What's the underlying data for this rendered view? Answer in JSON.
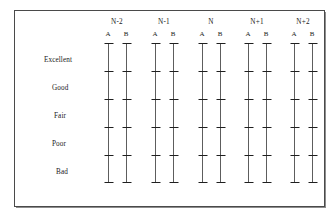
{
  "figure": {
    "title": "",
    "row_labels": [
      "Excellent",
      "Good",
      "Fair",
      "Poor",
      "Bad"
    ],
    "group_labels": [
      "N-2",
      "N-1",
      "N",
      "N+1",
      "N+2"
    ],
    "sub_labels": [
      "A",
      "B"
    ],
    "line_color": "#5d5d5d",
    "tick_color": "#1f1f1f",
    "border_color": "#4a4a4a",
    "background": "#ffffff"
  },
  "chart_data": {
    "type": "scatter",
    "title": "",
    "xlabel": "",
    "ylabel": "",
    "grid": false,
    "legend": "none",
    "categories": [
      "N-2",
      "N-1",
      "N",
      "N+1",
      "N+2"
    ],
    "subcategories": [
      "A",
      "B"
    ],
    "y_categories": [
      "Excellent",
      "Good",
      "Fair",
      "Poor",
      "Bad"
    ],
    "ylim": [
      0,
      5
    ],
    "ticks_per_axis": 6,
    "series": [
      {
        "name": "N-2 A",
        "group": "N-2",
        "sub": "A",
        "tick_levels": [
          5,
          4,
          3,
          2,
          1,
          0
        ]
      },
      {
        "name": "N-2 B",
        "group": "N-2",
        "sub": "B",
        "tick_levels": [
          5,
          4,
          3,
          2,
          1,
          0
        ]
      },
      {
        "name": "N-1 A",
        "group": "N-1",
        "sub": "A",
        "tick_levels": [
          5,
          4,
          3,
          2,
          1,
          0
        ]
      },
      {
        "name": "N-1 B",
        "group": "N-1",
        "sub": "B",
        "tick_levels": [
          5,
          4,
          3,
          2,
          1,
          0
        ]
      },
      {
        "name": "N A",
        "group": "N",
        "sub": "A",
        "tick_levels": [
          5,
          4,
          3,
          2,
          1,
          0
        ]
      },
      {
        "name": "N B",
        "group": "N",
        "sub": "B",
        "tick_levels": [
          5,
          4,
          3,
          2,
          1,
          0
        ]
      },
      {
        "name": "N+1 A",
        "group": "N+1",
        "sub": "A",
        "tick_levels": [
          5,
          4,
          3,
          2,
          1,
          0
        ]
      },
      {
        "name": "N+1 B",
        "group": "N+1",
        "sub": "B",
        "tick_levels": [
          5,
          4,
          3,
          2,
          1,
          0
        ]
      },
      {
        "name": "N+2 A",
        "group": "N+2",
        "sub": "A",
        "tick_levels": [
          5,
          4,
          3,
          2,
          1,
          0
        ]
      },
      {
        "name": "N+2 B",
        "group": "N+2",
        "sub": "B",
        "tick_levels": [
          5,
          4,
          3,
          2,
          1,
          0
        ]
      }
    ]
  },
  "layout": {
    "group_centers_px": [
      117,
      164,
      211,
      257,
      303
    ],
    "sub_offset_px": 9,
    "axis_top_px": 43,
    "axis_bottom_px": 182,
    "tick_rows_px": [
      43,
      71,
      99,
      127,
      155,
      182
    ],
    "row_label_y_px": [
      57,
      85,
      113,
      141,
      169
    ],
    "row_label_x_px": [
      44,
      52,
      54,
      52,
      56
    ],
    "group_header_y_px": 19,
    "ab_label_y_px": 31,
    "tick_width_px": 9,
    "cap_width_px": 9
  }
}
